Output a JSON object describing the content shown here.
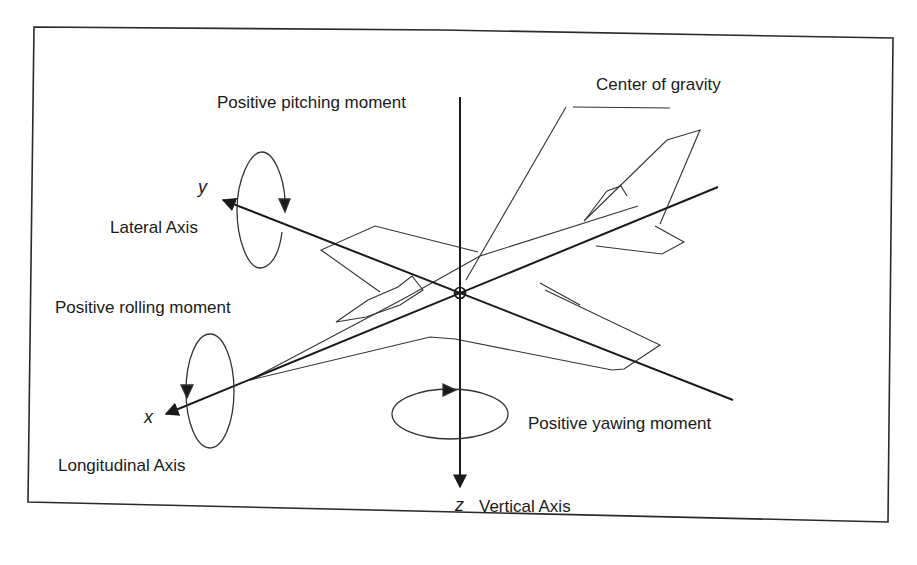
{
  "diagram": {
    "labels": {
      "pitching": "Positive pitching moment",
      "cg": "Center of gravity",
      "lateral": "Lateral Axis",
      "rolling": "Positive rolling moment",
      "longitudinal": "Longitudinal Axis",
      "yawing": "Positive yawing moment",
      "vertical": "Vertical Axis"
    },
    "axes": {
      "x": "x",
      "y": "y",
      "z": "z"
    },
    "colors": {
      "line": "#1a1a1a",
      "frame": "#2a2a2a",
      "background": "#ffffff"
    }
  }
}
